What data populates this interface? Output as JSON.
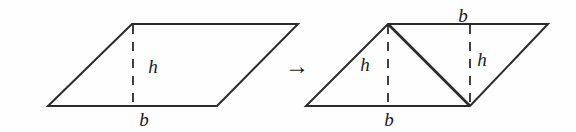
{
  "figure": {
    "stroke_color": "#2b2b2b",
    "dash_color": "#2b2b2b",
    "background_color": "#fefefe",
    "transform_symbol": "→",
    "left_figure": {
      "name": "parallelogram",
      "vertices": [
        {
          "x": 48,
          "y": 106
        },
        {
          "x": 132,
          "y": 24
        },
        {
          "x": 298,
          "y": 24
        },
        {
          "x": 217,
          "y": 106
        }
      ],
      "height_segment": {
        "x": 133,
        "y1": 25,
        "y2": 105,
        "style": "dashed"
      },
      "labels": [
        {
          "text": "h",
          "x": 153,
          "y": 66
        },
        {
          "text": "b",
          "x": 144,
          "y": 119
        }
      ]
    },
    "right_figure": {
      "name": "parallelogram-split-into-triangles",
      "vertices": [
        {
          "x": 306,
          "y": 106
        },
        {
          "x": 388,
          "y": 24
        },
        {
          "x": 548,
          "y": 24
        },
        {
          "x": 470,
          "y": 106
        }
      ],
      "diagonal": {
        "x1": 388,
        "y1": 24,
        "x2": 470,
        "y2": 106
      },
      "height_segments": [
        {
          "x": 388,
          "y1": 25,
          "y2": 105,
          "style": "dashed"
        },
        {
          "x": 470,
          "y1": 25,
          "y2": 105,
          "style": "dashed"
        }
      ],
      "labels": [
        {
          "text": "h",
          "x": 365,
          "y": 64
        },
        {
          "text": "h",
          "x": 482,
          "y": 59
        },
        {
          "text": "b",
          "x": 463,
          "y": 15
        },
        {
          "text": "b",
          "x": 389,
          "y": 119
        }
      ]
    },
    "arrow": {
      "text": "→",
      "x": 297,
      "y": 66
    }
  }
}
